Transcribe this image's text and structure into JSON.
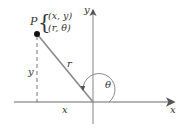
{
  "diagram": {
    "colors": {
      "axis": "#9a9a9a",
      "line": "#8a8a8a",
      "text": "#333333",
      "point": "#111111"
    },
    "point": {
      "name": "P",
      "rect_coords": "(x, y)",
      "polar_coords": "(r, θ)"
    },
    "labels": {
      "x_axis": "x",
      "y_axis": "y",
      "horizontal_segment": "x",
      "vertical_segment": "y",
      "radius": "r",
      "angle": "θ"
    }
  }
}
